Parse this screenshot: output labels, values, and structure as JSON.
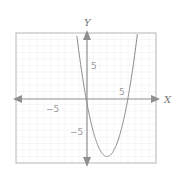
{
  "chart_data": {
    "type": "line",
    "title": "",
    "xlabel": "X",
    "ylabel": "Y",
    "xlim": [
      -10,
      10
    ],
    "ylim": [
      -10,
      10
    ],
    "grid": true,
    "x_ticks_labeled": [
      -5,
      5
    ],
    "y_ticks_labeled": [
      -5,
      5
    ],
    "x_tick_labels": [
      "−5",
      "5"
    ],
    "y_tick_labels": [
      "−5",
      "5"
    ],
    "series": [
      {
        "name": "y = x^2 - 6x",
        "equation": "y = x^2 - 6x",
        "x": [
          -1.36,
          -1,
          0,
          1,
          2,
          3,
          4,
          5,
          6,
          7,
          7.36
        ],
        "y": [
          10,
          7,
          0,
          -5,
          -8,
          -9,
          -8,
          -5,
          0,
          7,
          10
        ],
        "color": "#8a8a8a"
      }
    ],
    "key_points": {
      "roots": [
        0,
        6
      ],
      "vertex": [
        3,
        -9
      ],
      "y_intercept": 0
    },
    "legend": null
  },
  "colors": {
    "axis": "#8f8f8f",
    "frame": "#b5b5b5",
    "grid": "#f1f1f1",
    "curve": "#8a8a8a"
  }
}
